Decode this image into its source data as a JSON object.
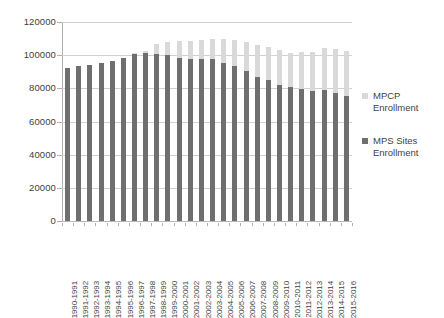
{
  "chart_data": {
    "type": "bar",
    "subtype": "stacked-column",
    "title": "",
    "xlabel": "",
    "ylabel": "",
    "ylim": [
      0,
      120000
    ],
    "ytick_step": 20000,
    "ytick_labels": [
      "0",
      "20000",
      "40000",
      "60000",
      "80000",
      "100000",
      "120000"
    ],
    "ytick_values": [
      0,
      20000,
      40000,
      60000,
      80000,
      100000,
      120000
    ],
    "grid": true,
    "legend_position": "right",
    "categories": [
      "1990-1991",
      "1991-1992",
      "1992-1993",
      "1993-1994",
      "1994-1995",
      "1995-1996",
      "1996-1997",
      "1997-1998",
      "1998-1999",
      "1999-2000",
      "2000-2001",
      "2001-2002",
      "2002-2003",
      "2003-2004",
      "2004-2005",
      "2005-2006",
      "2006-2007",
      "2007-2008",
      "2008-2009",
      "2009-2010",
      "2010-2011",
      "2011-2012",
      "2012-2013",
      "2013-2014",
      "2014-2015",
      "2015-2016"
    ],
    "series": [
      {
        "name": "MPS Sites Enrollment",
        "color": "#6f6f6f",
        "values": [
          92500,
          93500,
          94000,
          95000,
          96500,
          98500,
          101000,
          101500,
          100500,
          100000,
          98000,
          97500,
          97500,
          97500,
          95500,
          93500,
          90500,
          87000,
          85000,
          82000,
          81000,
          79500,
          78500,
          79000,
          77000,
          75500
        ]
      },
      {
        "name": "MPCP Enrollment",
        "color": "#d9d9d9",
        "values": [
          0,
          0,
          0,
          0,
          0,
          0,
          500,
          1000,
          6000,
          8000,
          10500,
          11000,
          11500,
          12500,
          14500,
          15500,
          17500,
          19000,
          20000,
          21000,
          20500,
          22500,
          23500,
          25500,
          26500,
          27000
        ]
      }
    ],
    "totals": [
      92500,
      93500,
      94000,
      95000,
      96500,
      98500,
      101500,
      102500,
      106500,
      108000,
      108500,
      108500,
      109000,
      110000,
      110000,
      109000,
      108000,
      106000,
      105000,
      103000,
      101500,
      102000,
      102000,
      104500,
      103500,
      102500
    ]
  },
  "legend": {
    "items": [
      {
        "label_line1": "MPCP",
        "label_line2": "Enrollment",
        "color": "#d9d9d9"
      },
      {
        "label_line1": "MPS Sites",
        "label_line2": "Enrollment",
        "color": "#6f6f6f"
      }
    ]
  }
}
